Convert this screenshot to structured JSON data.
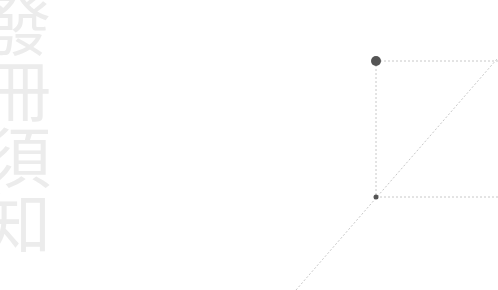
{
  "watermark": {
    "text": "發冊須知",
    "color": "#ececec"
  },
  "diagram": {
    "line_color": "#c8c8c8",
    "dot_color": "#555555",
    "points": [
      {
        "name": "top-point",
        "x": 376,
        "y": 61,
        "r": 5
      },
      {
        "name": "bottom-point",
        "x": 376,
        "y": 197,
        "r": 2.5
      }
    ],
    "lines": [
      {
        "name": "vertical-guide",
        "x1": 376,
        "y1": 61,
        "x2": 376,
        "y2": 197
      },
      {
        "name": "top-horizontal-guide",
        "x1": 376,
        "y1": 61,
        "x2": 498,
        "y2": 61
      },
      {
        "name": "bottom-horizontal-guide",
        "x1": 376,
        "y1": 197,
        "x2": 498,
        "y2": 197
      },
      {
        "name": "diagonal-line",
        "x1": 296,
        "y1": 290,
        "x2": 497,
        "y2": 59
      }
    ]
  }
}
